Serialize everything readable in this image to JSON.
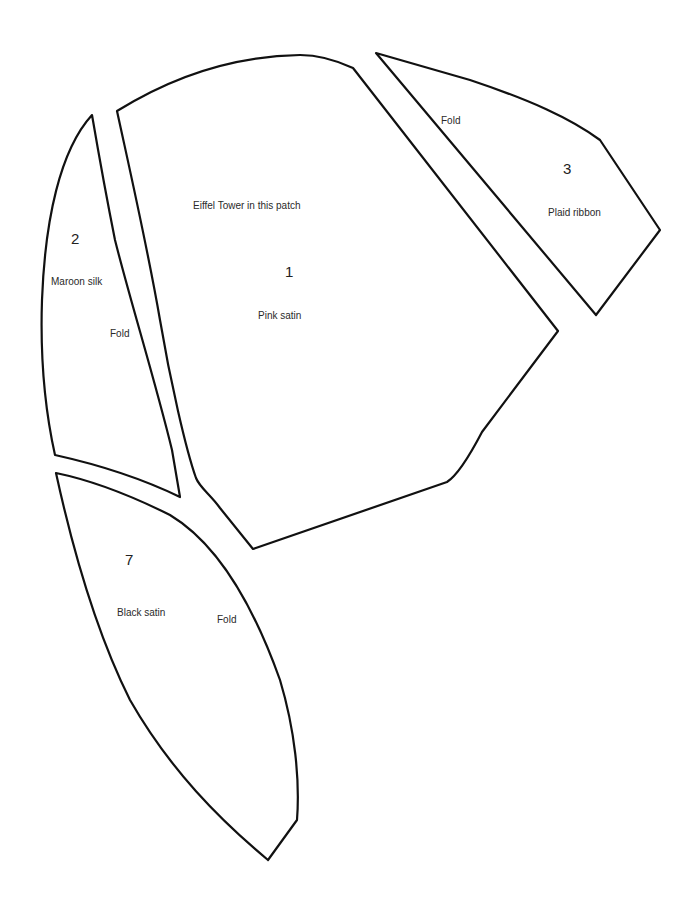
{
  "pieces": [
    {
      "number": "1",
      "material": "Pink satin",
      "note": "Eiffel Tower in this patch"
    },
    {
      "number": "2",
      "material": "Maroon silk",
      "fold": "Fold"
    },
    {
      "number": "3",
      "material": "Plaid ribbon",
      "fold": "Fold"
    },
    {
      "number": "7",
      "material": "Black satin",
      "fold": "Fold"
    }
  ],
  "colors": {
    "outline": "#111111",
    "text": "#2a2a2a",
    "background": "#ffffff"
  }
}
